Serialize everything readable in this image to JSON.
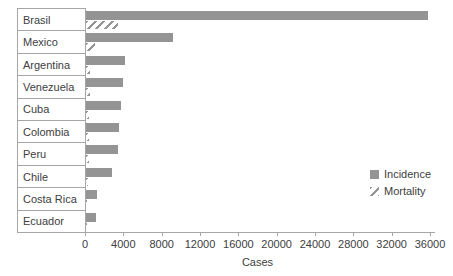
{
  "chart_data": {
    "type": "bar",
    "orientation": "horizontal",
    "xlabel": "Cases",
    "categories": [
      "Brasil",
      "Mexico",
      "Argentina",
      "Venezuela",
      "Cuba",
      "Colombia",
      "Peru",
      "Chile",
      "Costa Rica",
      "Ecuador"
    ],
    "series": [
      {
        "name": "Incidence",
        "pattern": "solid",
        "color": "#949494",
        "values": [
          35800,
          9100,
          4100,
          3900,
          3700,
          3500,
          3350,
          2750,
          1150,
          1000
        ]
      },
      {
        "name": "Mortality",
        "pattern": "diagonal-hatch",
        "color": "#949494",
        "values": [
          3300,
          900,
          400,
          380,
          320,
          300,
          280,
          200,
          120,
          150
        ]
      }
    ],
    "xlim": [
      0,
      36000
    ],
    "xticks": [
      0,
      4000,
      8000,
      12000,
      16000,
      20000,
      24000,
      28000,
      32000,
      36000
    ],
    "grid": false,
    "legend_position": "middle-right"
  },
  "colors": {
    "bar_fill": "#949494",
    "axis_line": "#a6a6a6",
    "text": "#404040",
    "background": "#ffffff"
  }
}
